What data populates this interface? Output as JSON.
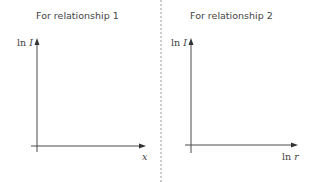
{
  "panels": [
    {
      "title": "For relationship 1",
      "y_axis_label": {
        "prefix": "ln",
        "var": "I"
      },
      "x_axis_label": {
        "prefix": "",
        "var": "x"
      }
    },
    {
      "title": "For relationship 2",
      "y_axis_label": {
        "prefix": "ln",
        "var": "I"
      },
      "x_axis_label": {
        "prefix": "ln",
        "var": "r"
      }
    }
  ],
  "colors": {
    "axis": "#4a4a4a",
    "divider": "#9a9a9a",
    "text": "#444444"
  }
}
